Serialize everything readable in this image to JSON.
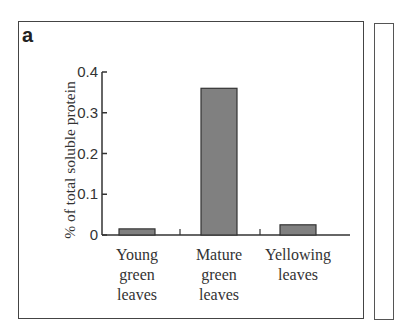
{
  "panel_label": "a",
  "chart_data": {
    "type": "bar",
    "title": "",
    "xlabel": "",
    "ylabel": "% of total soluble protein",
    "categories": [
      "Young green leaves",
      "Mature green leaves",
      "Yellowing leaves"
    ],
    "category_lines": [
      [
        "Young",
        "green",
        "leaves"
      ],
      [
        "Mature",
        "green",
        "leaves"
      ],
      [
        "Yellowing",
        "leaves"
      ]
    ],
    "values": [
      0.015,
      0.36,
      0.025
    ],
    "ylim": [
      0,
      0.4
    ],
    "yticks": [
      "0",
      "0.1",
      "0.2",
      "0.3",
      "0.4"
    ],
    "grid": false,
    "legend": null,
    "bar_color": "#808080"
  }
}
